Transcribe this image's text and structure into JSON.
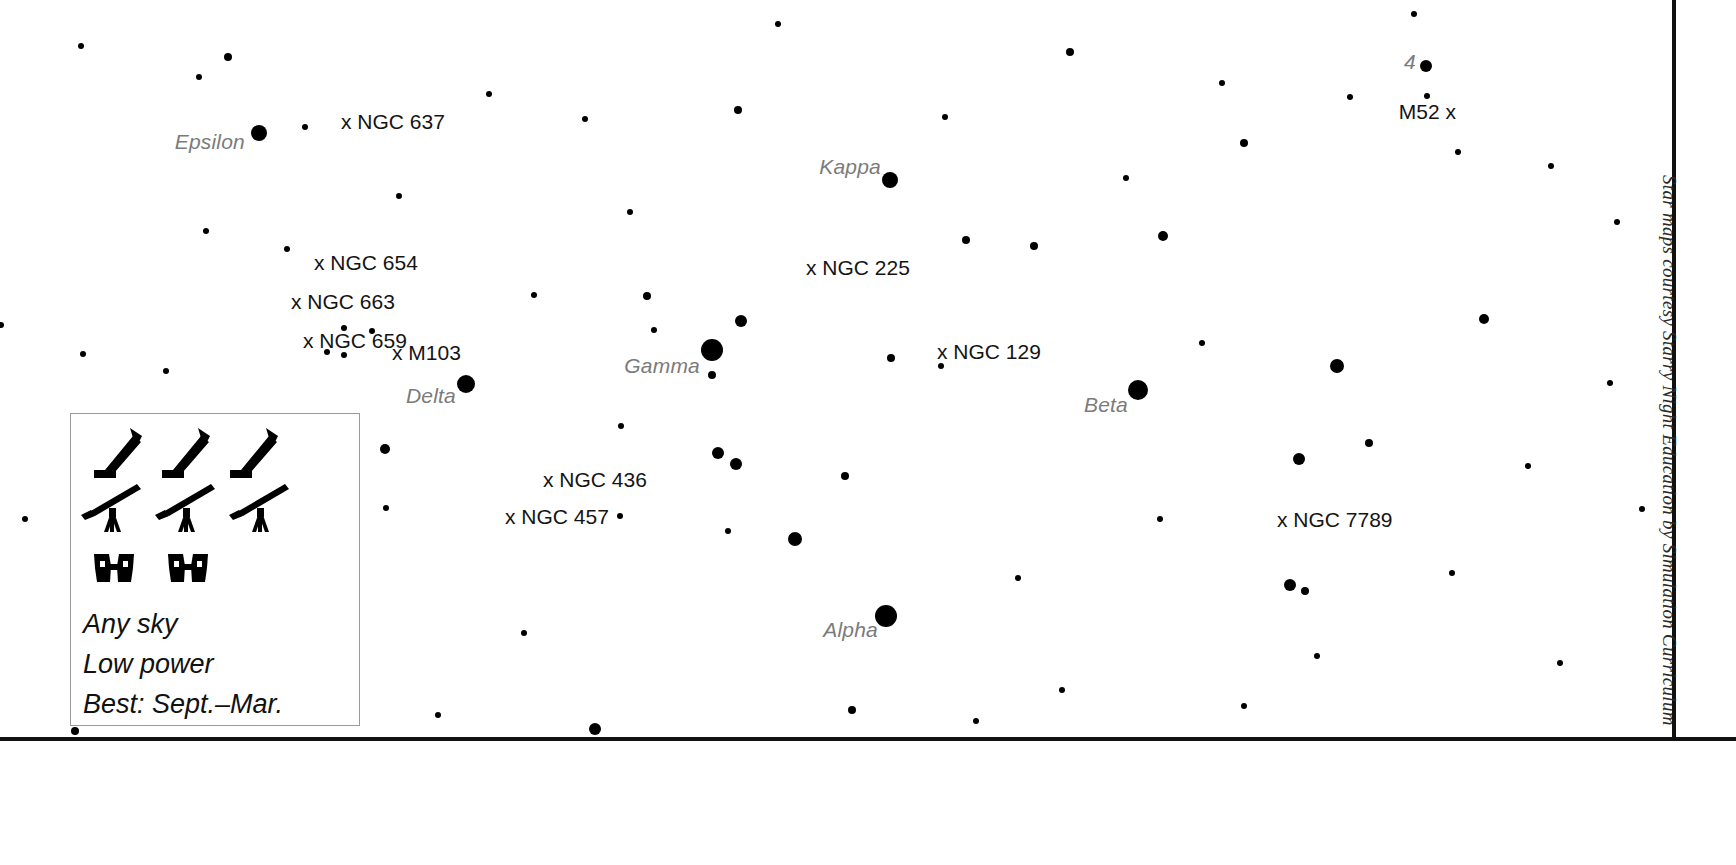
{
  "map": {
    "constellation": "Cassiopeia",
    "width": 1736,
    "height": 865,
    "background_color": "#ffffff",
    "star_color": "#000000",
    "star_label_color": "#7b7b7b",
    "dso_label_color": "#141414",
    "frame_color": "#111111"
  },
  "credit": {
    "text": "Star maps courtesy Starry Night Education by Simulation Curriculum"
  },
  "star_labels": [
    {
      "text": "Epsilon",
      "x": 245,
      "y": 142,
      "star_x": 259,
      "star_y": 133,
      "star_r": 8
    },
    {
      "text": "Kappa",
      "x": 881,
      "y": 167,
      "star_x": 890,
      "star_y": 180,
      "star_r": 8
    },
    {
      "text": "Gamma",
      "x": 700,
      "y": 366,
      "star_x": 712,
      "star_y": 350,
      "star_r": 11
    },
    {
      "text": "Delta",
      "x": 456,
      "y": 396,
      "star_x": 466,
      "star_y": 384,
      "star_r": 9
    },
    {
      "text": "Beta",
      "x": 1128,
      "y": 405,
      "star_x": 1138,
      "star_y": 390,
      "star_r": 10
    },
    {
      "text": "Alpha",
      "x": 878,
      "y": 630,
      "star_x": 886,
      "star_y": 616,
      "star_r": 11
    },
    {
      "text": "4",
      "x": 1416,
      "y": 62,
      "star_x": 1426,
      "star_y": 66,
      "star_r": 6
    }
  ],
  "dso_labels": [
    {
      "text": "x NGC 637",
      "x": 341,
      "y": 122,
      "align": "left"
    },
    {
      "text": "x NGC 654",
      "x": 314,
      "y": 263,
      "align": "left"
    },
    {
      "text": "x NGC 663",
      "x": 291,
      "y": 302,
      "align": "left"
    },
    {
      "text": "x NGC 659",
      "x": 303,
      "y": 341,
      "align": "left"
    },
    {
      "text": "x M103",
      "x": 392,
      "y": 353,
      "align": "left"
    },
    {
      "text": "x NGC 225",
      "x": 806,
      "y": 268,
      "align": "left"
    },
    {
      "text": "x NGC 129",
      "x": 937,
      "y": 352,
      "align": "left"
    },
    {
      "text": "x NGC 436",
      "x": 543,
      "y": 480,
      "align": "left"
    },
    {
      "text": "x NGC 457",
      "x": 505,
      "y": 517,
      "align": "left"
    },
    {
      "text": "x NGC 7789",
      "x": 1277,
      "y": 520,
      "align": "left"
    },
    {
      "text": "M52 x",
      "x": 1456,
      "y": 112,
      "align": "right"
    }
  ],
  "legend": {
    "icons": {
      "dobsonian_count": 3,
      "refractor_count": 3,
      "binocular_count": 2,
      "dobsonian_name": "dobsonian-telescope-icon",
      "refractor_name": "refractor-telescope-icon",
      "binocular_name": "binoculars-icon"
    },
    "lines": [
      "Any sky",
      "Low power",
      "Best: Sept.–Mar."
    ]
  },
  "stars": [
    {
      "x": 259,
      "y": 133,
      "r": 8
    },
    {
      "x": 890,
      "y": 180,
      "r": 8
    },
    {
      "x": 712,
      "y": 350,
      "r": 11
    },
    {
      "x": 466,
      "y": 384,
      "r": 9
    },
    {
      "x": 1138,
      "y": 390,
      "r": 10
    },
    {
      "x": 886,
      "y": 616,
      "r": 11
    },
    {
      "x": 1426,
      "y": 66,
      "r": 6
    },
    {
      "x": 741,
      "y": 321,
      "r": 6
    },
    {
      "x": 718,
      "y": 453,
      "r": 6
    },
    {
      "x": 736,
      "y": 464,
      "r": 6
    },
    {
      "x": 795,
      "y": 539,
      "r": 7
    },
    {
      "x": 1337,
      "y": 366,
      "r": 7
    },
    {
      "x": 1299,
      "y": 459,
      "r": 6
    },
    {
      "x": 1290,
      "y": 585,
      "r": 6
    },
    {
      "x": 1305,
      "y": 591,
      "r": 4
    },
    {
      "x": 1484,
      "y": 319,
      "r": 5
    },
    {
      "x": 595,
      "y": 729,
      "r": 6
    },
    {
      "x": 385,
      "y": 449,
      "r": 5
    },
    {
      "x": 1163,
      "y": 236,
      "r": 5
    },
    {
      "x": 1070,
      "y": 52,
      "r": 4
    },
    {
      "x": 1244,
      "y": 143,
      "r": 4
    },
    {
      "x": 966,
      "y": 240,
      "r": 4
    },
    {
      "x": 1034,
      "y": 246,
      "r": 4
    },
    {
      "x": 738,
      "y": 110,
      "r": 4
    },
    {
      "x": 228,
      "y": 57,
      "r": 4
    },
    {
      "x": 199,
      "y": 77,
      "r": 3
    },
    {
      "x": 891,
      "y": 358,
      "r": 4
    },
    {
      "x": 647,
      "y": 296,
      "r": 4
    },
    {
      "x": 654,
      "y": 330,
      "r": 3
    },
    {
      "x": 1369,
      "y": 443,
      "r": 4
    },
    {
      "x": 845,
      "y": 476,
      "r": 4
    },
    {
      "x": 852,
      "y": 710,
      "r": 4
    },
    {
      "x": 976,
      "y": 721,
      "r": 3
    },
    {
      "x": 1126,
      "y": 178,
      "r": 3
    },
    {
      "x": 941,
      "y": 366,
      "r": 3
    },
    {
      "x": 620,
      "y": 516,
      "r": 3
    },
    {
      "x": 386,
      "y": 508,
      "r": 3
    },
    {
      "x": 305,
      "y": 127,
      "r": 3
    },
    {
      "x": 81,
      "y": 46,
      "r": 3
    },
    {
      "x": 1414,
      "y": 14,
      "r": 3
    },
    {
      "x": 778,
      "y": 24,
      "r": 3
    },
    {
      "x": 585,
      "y": 119,
      "r": 3
    },
    {
      "x": 399,
      "y": 196,
      "r": 3
    },
    {
      "x": 206,
      "y": 231,
      "r": 3
    },
    {
      "x": 630,
      "y": 212,
      "r": 3
    },
    {
      "x": 534,
      "y": 295,
      "r": 3
    },
    {
      "x": 1202,
      "y": 343,
      "r": 3
    },
    {
      "x": 621,
      "y": 426,
      "r": 3
    },
    {
      "x": 1,
      "y": 325,
      "r": 3
    },
    {
      "x": 166,
      "y": 371,
      "r": 3
    },
    {
      "x": 96,
      "y": 437,
      "r": 3
    },
    {
      "x": 83,
      "y": 354,
      "r": 3
    },
    {
      "x": 25,
      "y": 519,
      "r": 3
    },
    {
      "x": 1018,
      "y": 578,
      "r": 3
    },
    {
      "x": 1160,
      "y": 519,
      "r": 3
    },
    {
      "x": 1452,
      "y": 573,
      "r": 3
    },
    {
      "x": 1317,
      "y": 656,
      "r": 3
    },
    {
      "x": 728,
      "y": 531,
      "r": 3
    },
    {
      "x": 524,
      "y": 633,
      "r": 3
    },
    {
      "x": 226,
      "y": 672,
      "r": 3
    },
    {
      "x": 438,
      "y": 715,
      "r": 3
    },
    {
      "x": 1062,
      "y": 690,
      "r": 3
    },
    {
      "x": 1244,
      "y": 706,
      "r": 3
    },
    {
      "x": 1458,
      "y": 152,
      "r": 3
    },
    {
      "x": 1350,
      "y": 97,
      "r": 3
    },
    {
      "x": 1222,
      "y": 83,
      "r": 3
    },
    {
      "x": 945,
      "y": 117,
      "r": 3
    },
    {
      "x": 1551,
      "y": 166,
      "r": 3
    },
    {
      "x": 1617,
      "y": 222,
      "r": 3
    },
    {
      "x": 1610,
      "y": 383,
      "r": 3
    },
    {
      "x": 1528,
      "y": 466,
      "r": 3
    },
    {
      "x": 1642,
      "y": 509,
      "r": 3
    },
    {
      "x": 1560,
      "y": 663,
      "r": 3
    },
    {
      "x": 1427,
      "y": 96,
      "r": 3
    },
    {
      "x": 489,
      "y": 94,
      "r": 3
    },
    {
      "x": 287,
      "y": 249,
      "r": 3
    },
    {
      "x": 344,
      "y": 328,
      "r": 3
    },
    {
      "x": 372,
      "y": 331,
      "r": 3
    },
    {
      "x": 327,
      "y": 352,
      "r": 3
    },
    {
      "x": 344,
      "y": 355,
      "r": 3
    },
    {
      "x": 712,
      "y": 375,
      "r": 4
    },
    {
      "x": 75,
      "y": 731,
      "r": 4
    },
    {
      "x": 182,
      "y": 440,
      "r": 3
    },
    {
      "x": 211,
      "y": 509,
      "r": 3
    }
  ]
}
